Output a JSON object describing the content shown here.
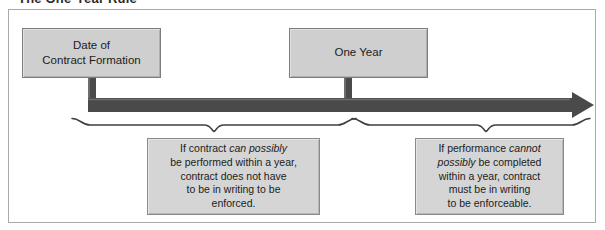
{
  "title": "The One-Year Rule",
  "boxes": {
    "date_of_contract": {
      "line1": "Date of",
      "line2": "Contract Formation"
    },
    "one_year": {
      "line1": "One Year"
    }
  },
  "callouts": {
    "left": {
      "line1_pre": "If contract ",
      "line1_em": "can possibly",
      "line2": "be performed within a year,",
      "line3": "contract does not have",
      "line4": "to be in writing to be",
      "line5": "enforced."
    },
    "right": {
      "line1_pre": "If performance ",
      "line1_em": "cannot",
      "line2_em": "possibly",
      "line2_post": " be completed",
      "line3": "within a year, contract",
      "line4": "must be in writing",
      "line5": "to be enforceable."
    }
  },
  "colors": {
    "box_fill": "#cfcfcf",
    "callout_fill": "#d5d5d5",
    "box_border": "#7d7d7d",
    "arrow": "#4a4a4a",
    "frame_border": "#a9a9a9",
    "text": "#1c1c1c"
  },
  "timeline": {
    "arrow_direction": "right",
    "start_marker": "contract-formation-tick",
    "mid_marker": "one-year-tick",
    "brace_left_label": "spans from contract formation to one year",
    "brace_right_label": "spans from one year to the right end of the timeline"
  }
}
